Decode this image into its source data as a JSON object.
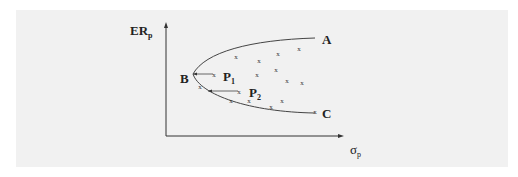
{
  "diagram": {
    "y_axis_label": {
      "main": "ER",
      "sub": "p"
    },
    "x_axis_label": {
      "main": "σ",
      "sub": "p"
    },
    "points": {
      "A": "A",
      "B": "B",
      "C": "C",
      "P1": {
        "main": "P",
        "sub": "1"
      },
      "P2": {
        "main": "P",
        "sub": "2"
      }
    },
    "marker_glyph": "x",
    "markers": [
      [
        236,
        57
      ],
      [
        259,
        61
      ],
      [
        278,
        54
      ],
      [
        299,
        49
      ],
      [
        257,
        75
      ],
      [
        276,
        70
      ],
      [
        287,
        81
      ],
      [
        302,
        83
      ],
      [
        214,
        75
      ],
      [
        239,
        92
      ],
      [
        200,
        87
      ],
      [
        231,
        101
      ],
      [
        249,
        101
      ],
      [
        271,
        107
      ],
      [
        282,
        101
      ],
      [
        315,
        112
      ]
    ],
    "colors": {
      "background": "#f1f1f1",
      "ink": "#333333"
    }
  }
}
